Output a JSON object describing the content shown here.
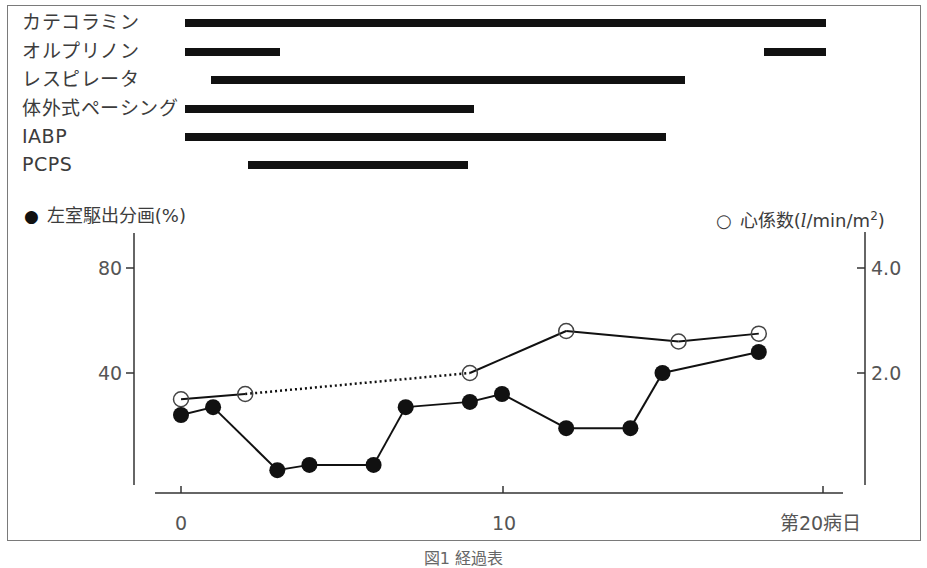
{
  "chart_data": [
    {
      "type": "gantt",
      "title": "",
      "x_unit": "病日",
      "xlim": [
        0,
        20
      ],
      "rows": [
        {
          "label": "カテコラミン",
          "segments": [
            [
              0.1,
              20.0
            ]
          ]
        },
        {
          "label": "オルプリノン",
          "segments": [
            [
              0.1,
              3.1
            ],
            [
              18.2,
              20.0
            ]
          ]
        },
        {
          "label": "レスピレータ",
          "segments": [
            [
              0.9,
              15.7
            ]
          ]
        },
        {
          "label": "体外式ペーシング",
          "segments": [
            [
              0.1,
              9.1
            ]
          ]
        },
        {
          "label": "IABP",
          "segments": [
            [
              0.1,
              15.1
            ]
          ]
        },
        {
          "label": "PCPS",
          "segments": [
            [
              2.1,
              8.9
            ]
          ]
        }
      ]
    },
    {
      "type": "line",
      "xlabel": "第20病日",
      "x_ticks": [
        "0",
        "10",
        "第20病日"
      ],
      "x_tick_values": [
        0,
        10,
        20
      ],
      "xlim": [
        0,
        20
      ],
      "ylabel_left": "左室駆出分画(%)",
      "ylabel_right": "心係数(l/min/m²)",
      "ylim_left": [
        0,
        100
      ],
      "ylim_right": [
        0,
        5.0
      ],
      "y_ticks_left": [
        "80",
        "40"
      ],
      "y_ticks_right": [
        "4.0",
        "2.0"
      ],
      "grid": false,
      "series": [
        {
          "name": "左室駆出分画(%)",
          "marker": "filled-circle",
          "axis": "left",
          "x": [
            0,
            1,
            3,
            4,
            6,
            7,
            9,
            10,
            12,
            14,
            15,
            18
          ],
          "values": [
            24,
            27,
            3,
            5,
            5,
            27,
            29,
            32,
            19,
            19,
            40,
            48
          ]
        },
        {
          "name": "心係数(l/min/m²)",
          "marker": "open-circle",
          "axis": "right",
          "x": [
            0,
            2,
            9,
            12,
            15.5,
            18
          ],
          "values": [
            1.5,
            1.6,
            2.0,
            2.8,
            2.6,
            2.75
          ],
          "dotted_segments": [
            [
              2,
              9
            ]
          ]
        }
      ]
    }
  ],
  "therapy_rows": [
    {
      "label": "カテコラミン",
      "bars": [
        [
          185,
          826
        ]
      ],
      "y": 19
    },
    {
      "label": "オルプリノン",
      "bars": [
        [
          185,
          280
        ],
        [
          764,
          826
        ]
      ],
      "y": 48
    },
    {
      "label": "レスピレータ",
      "bars": [
        [
          211,
          685
        ]
      ],
      "y": 76
    },
    {
      "label": "体外式ペーシング",
      "bars": [
        [
          185,
          474
        ]
      ],
      "y": 105
    },
    {
      "label": "IABP",
      "bars": [
        [
          185,
          666
        ]
      ],
      "y": 133
    },
    {
      "label": "PCPS",
      "bars": [
        [
          248,
          468
        ]
      ],
      "y": 161
    }
  ],
  "legend": {
    "left_symbol": "●",
    "left_label": "左室駆出分画(%)",
    "right_symbol": "○",
    "right_label_prefix": "心係数(",
    "right_label_unit_l": "l",
    "right_label_unit_rest": "/min/m",
    "right_label_sup": "2",
    "right_label_suffix": ")"
  },
  "axes": {
    "left_ticks": [
      {
        "label": "80",
        "y": 268
      },
      {
        "label": "40",
        "y": 373
      }
    ],
    "right_ticks": [
      {
        "label": "4.0",
        "y": 268
      },
      {
        "label": "2.0",
        "y": 373
      }
    ],
    "x_ticks": [
      {
        "label": "0",
        "x": 181
      },
      {
        "label": "10",
        "x": 503
      },
      {
        "label": "第20病日",
        "x": 823
      }
    ]
  },
  "caption": "図1 経過表",
  "colors": {
    "ink": "#111111",
    "frame": "#7a7a7a",
    "text": "#3c3c3c"
  }
}
